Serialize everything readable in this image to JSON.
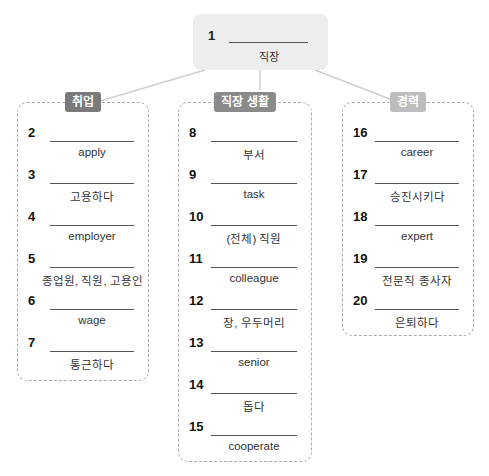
{
  "root": {
    "number": "1",
    "hint": "직장"
  },
  "groups": [
    {
      "label": "취업",
      "label_color": "#7a7a7a",
      "items": [
        {
          "number": "2",
          "hint": "apply"
        },
        {
          "number": "3",
          "hint": "고용하다"
        },
        {
          "number": "4",
          "hint": "employer"
        },
        {
          "number": "5",
          "hint": "종업원, 직원, 고용인"
        },
        {
          "number": "6",
          "hint": "wage"
        },
        {
          "number": "7",
          "hint": "통근하다"
        }
      ]
    },
    {
      "label": "직장 생활",
      "label_color": "#8a8a8a",
      "items": [
        {
          "number": "8",
          "hint": "부서"
        },
        {
          "number": "9",
          "hint": "task"
        },
        {
          "number": "10",
          "hint": "(전체) 직원"
        },
        {
          "number": "11",
          "hint": "colleague"
        },
        {
          "number": "12",
          "hint": "장, 우두머리"
        },
        {
          "number": "13",
          "hint": "senior"
        },
        {
          "number": "14",
          "hint": "돕다"
        },
        {
          "number": "15",
          "hint": "cooperate"
        }
      ]
    },
    {
      "label": "경력",
      "label_color": "#bdbdbd",
      "items": [
        {
          "number": "16",
          "hint": "career"
        },
        {
          "number": "17",
          "hint": "승진시키다"
        },
        {
          "number": "18",
          "hint": "expert"
        },
        {
          "number": "19",
          "hint": "전문직 종사자"
        },
        {
          "number": "20",
          "hint": "은퇴하다"
        }
      ]
    }
  ]
}
